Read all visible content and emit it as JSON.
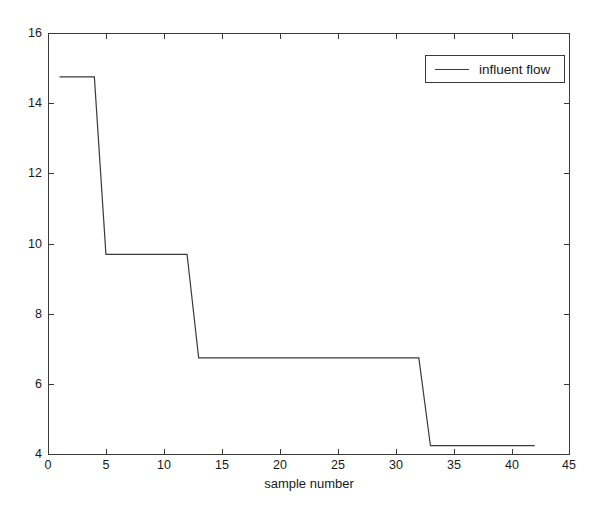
{
  "chart_data": {
    "type": "line",
    "title": "",
    "xlabel": "sample number",
    "ylabel": "",
    "xlim": [
      0,
      45
    ],
    "ylim": [
      4,
      16
    ],
    "xticks": [
      0,
      5,
      10,
      15,
      20,
      25,
      30,
      35,
      40,
      45
    ],
    "xticklabels": [
      "0",
      "5",
      "10",
      "15",
      "20",
      "25",
      "30",
      "35",
      "40",
      "45"
    ],
    "yticks": [
      4,
      6,
      8,
      10,
      12,
      14,
      16
    ],
    "yticklabels": [
      "4",
      "6",
      "8",
      "10",
      "12",
      "14",
      "16"
    ],
    "grid": false,
    "legend": {
      "position": "top-right",
      "entries": [
        {
          "label": "influent flow",
          "color": "#3a3a3a",
          "style": "solid"
        }
      ]
    },
    "series": [
      {
        "name": "influent flow",
        "color": "#3a3a3a",
        "x": [
          1,
          4,
          5,
          12,
          13,
          32,
          33,
          42
        ],
        "values": [
          14.75,
          14.75,
          9.7,
          9.7,
          6.75,
          6.75,
          4.25,
          4.25
        ]
      }
    ],
    "annotations": []
  },
  "axes": {
    "frame_color": "#3a3a3a",
    "background": "#ffffff"
  }
}
